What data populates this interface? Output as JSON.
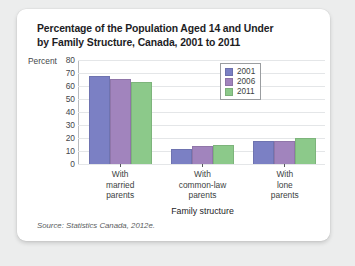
{
  "card": {
    "title_line1": "Percentage of the Population Aged 14 and Under",
    "title_line2": "by Family Structure, Canada, 2001 to 2011",
    "source": "Source: Statistics Canada, 2012e."
  },
  "chart_data": {
    "type": "bar",
    "title": "Percentage of the Population Aged 14 and Under by Family Structure, Canada, 2001 to 2011",
    "categories": [
      "With married parents",
      "With common-law parents",
      "With lone parents"
    ],
    "category_lines": [
      [
        "With",
        "married",
        "parents"
      ],
      [
        "With",
        "common-law",
        "parents"
      ],
      [
        "With",
        "lone",
        "parents"
      ]
    ],
    "series": [
      {
        "name": "2001",
        "values": [
          68,
          12,
          18
        ],
        "color": "#7b80c4"
      },
      {
        "name": "2006",
        "values": [
          66,
          14,
          18
        ],
        "color": "#a184bd"
      },
      {
        "name": "2011",
        "values": [
          64,
          15,
          20
        ],
        "color": "#8cc98a"
      }
    ],
    "xlabel": "Family structure",
    "ylabel": "Percent",
    "ylim": [
      0,
      80
    ],
    "yticks": [
      80,
      70,
      60,
      50,
      40,
      30,
      20,
      10,
      0
    ],
    "grid": true,
    "legend_position": "top-right"
  }
}
